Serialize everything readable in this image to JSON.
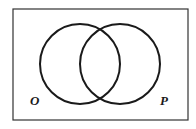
{
  "diagram": {
    "type": "venn",
    "sets": [
      {
        "label": "O",
        "cx": 80,
        "cy": 64,
        "r": 40
      },
      {
        "label": "P",
        "cx": 120,
        "cy": 64,
        "r": 40
      }
    ],
    "frame": {
      "x": 13,
      "y": 9,
      "width": 175,
      "height": 111
    },
    "colors": {
      "stroke": "#1a1a1a",
      "frame": "#333333",
      "background": "#ffffff"
    }
  },
  "labels": {
    "left": "O",
    "right": "P"
  }
}
